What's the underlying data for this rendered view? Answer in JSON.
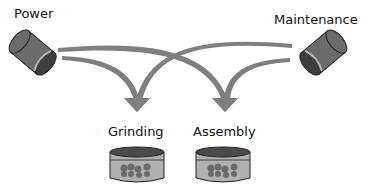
{
  "sources": [
    {
      "id": "power",
      "label": "Power"
    },
    {
      "id": "maintenance",
      "label": "Maintenance"
    }
  ],
  "targets": [
    {
      "id": "grinding",
      "label": "Grinding"
    },
    {
      "id": "assembly",
      "label": "Assembly"
    }
  ],
  "edges": [
    {
      "from": "Power",
      "to": "Grinding"
    },
    {
      "from": "Power",
      "to": "Assembly"
    },
    {
      "from": "Maintenance",
      "to": "Grinding"
    },
    {
      "from": "Maintenance",
      "to": "Assembly"
    }
  ],
  "colors": {
    "arrow": "#7f7f7f",
    "cylinder_body": "#6b6b6b",
    "cylinder_dark": "#3e3e3e",
    "cylinder_band": "#b8b8b8",
    "bin_top": "#4a4a4a",
    "bin_body": "#b0b0b0",
    "bin_dots": "#6a6a6a"
  }
}
